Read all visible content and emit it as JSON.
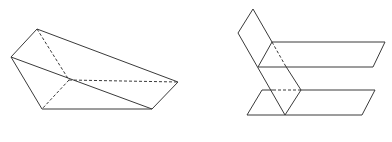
{
  "figures": [
    {
      "id": "left-solid",
      "description": "Triangular prism-like solid with hidden edges",
      "solid_edges": [
        [
          [
            37,
            29
          ],
          [
            11,
            57
          ]
        ],
        [
          [
            37,
            29
          ],
          [
            178,
            82
          ]
        ],
        [
          [
            11,
            57
          ],
          [
            42,
            109
          ]
        ],
        [
          [
            42,
            109
          ],
          [
            152,
            109
          ]
        ],
        [
          [
            152,
            109
          ],
          [
            178,
            82
          ]
        ],
        [
          [
            11,
            57
          ],
          [
            152,
            109
          ]
        ]
      ],
      "dashed_edges": [
        [
          [
            37,
            29
          ],
          [
            69,
            80
          ]
        ],
        [
          [
            69,
            80
          ],
          [
            42,
            109
          ]
        ],
        [
          [
            69,
            80
          ],
          [
            178,
            82
          ]
        ]
      ]
    },
    {
      "id": "right-planes",
      "description": "Inclined plane intersecting two parallel horizontal planes",
      "solid_edges": [
        [
          [
            238,
            33
          ],
          [
            253,
            9
          ]
        ],
        [
          [
            253,
            9
          ],
          [
            272,
            42
          ]
        ],
        [
          [
            238,
            33
          ],
          [
            285,
            115
          ]
        ],
        [
          [
            285,
            65
          ],
          [
            301,
            90
          ]
        ],
        [
          [
            301,
            90
          ],
          [
            285,
            115
          ]
        ],
        [
          [
            272,
            42
          ],
          [
            385,
            42
          ]
        ],
        [
          [
            385,
            42
          ],
          [
            373,
            67
          ]
        ],
        [
          [
            373,
            67
          ],
          [
            258,
            67
          ]
        ],
        [
          [
            258,
            67
          ],
          [
            272,
            42
          ]
        ],
        [
          [
            262,
            90
          ],
          [
            273,
            90
          ]
        ],
        [
          [
            301,
            90
          ],
          [
            375,
            90
          ]
        ],
        [
          [
            375,
            90
          ],
          [
            362,
            115
          ]
        ],
        [
          [
            362,
            115
          ],
          [
            247,
            115
          ]
        ],
        [
          [
            247,
            115
          ],
          [
            262,
            90
          ]
        ]
      ],
      "dashed_edges": [
        [
          [
            272,
            42
          ],
          [
            285,
            65
          ]
        ],
        [
          [
            273,
            90
          ],
          [
            301,
            90
          ]
        ]
      ]
    }
  ],
  "stroke_color": "#3a3a3a"
}
